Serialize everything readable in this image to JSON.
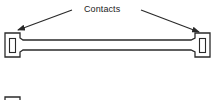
{
  "diagram": {
    "label": "Contacts",
    "colors": {
      "stroke": "#2a2a2a",
      "background": "#ffffff",
      "text": "#222222"
    },
    "elements": {
      "contacts_label": "Contacts",
      "left_contact": "contact pad (left)",
      "right_contact": "contact pad (right)",
      "bar": "connecting bar",
      "arrows": [
        "arrow to left contact",
        "arrow to right contact"
      ],
      "partial_square": "partial square (bottom-left, cut off)"
    }
  }
}
